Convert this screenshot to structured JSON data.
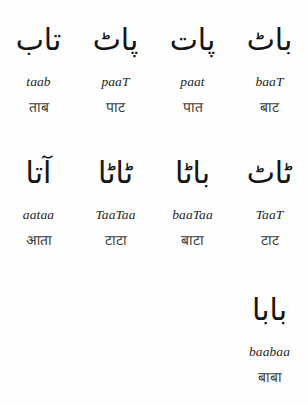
{
  "page": {
    "background_color": "#fefefe",
    "text_color": "#1a1a1a",
    "columns": 4,
    "rows": 3
  },
  "rows": [
    {
      "cells": [
        {
          "urdu": "تاب",
          "translit": "taab",
          "devanagari": "ताब"
        },
        {
          "urdu": "پاٹ",
          "translit": "paaT",
          "devanagari": "पाट"
        },
        {
          "urdu": "پات",
          "translit": "paat",
          "devanagari": "पात"
        },
        {
          "urdu": "باٹ",
          "translit": "baaT",
          "devanagari": "बाट"
        }
      ]
    },
    {
      "cells": [
        {
          "urdu": "آتا",
          "translit": "aataa",
          "devanagari": "आता"
        },
        {
          "urdu": "ٹاٹا",
          "translit": "TaaTaa",
          "devanagari": "टाटा"
        },
        {
          "urdu": "باٹا",
          "translit": "baaTaa",
          "devanagari": "बाटा"
        },
        {
          "urdu": "ٹاٹ",
          "translit": "TaaT",
          "devanagari": "टाट"
        }
      ]
    },
    {
      "cells": [
        {
          "urdu": "",
          "translit": "",
          "devanagari": ""
        },
        {
          "urdu": "",
          "translit": "",
          "devanagari": ""
        },
        {
          "urdu": "",
          "translit": "",
          "devanagari": ""
        },
        {
          "urdu": "بابا",
          "translit": "baabaa",
          "devanagari": "बाबा"
        }
      ]
    }
  ]
}
